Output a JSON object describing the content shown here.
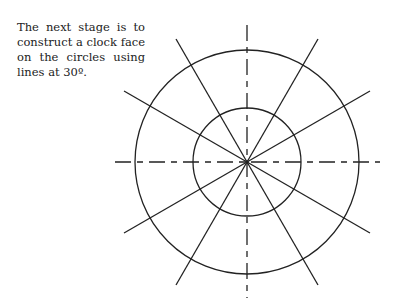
{
  "caption": "The next stage is to construct a clock face on the circles using lines at 30º.",
  "diagram": {
    "circles": [
      "outer-circle",
      "inner-circle"
    ],
    "line_angle_step_degrees": 30,
    "dashed_axes": [
      "horizontal",
      "vertical"
    ],
    "stroke_color": "#222222"
  }
}
